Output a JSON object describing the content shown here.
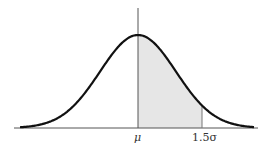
{
  "chart_data": {
    "type": "area",
    "title": "",
    "x_ticks": [
      "μ",
      "1.5σ"
    ],
    "shaded_region": {
      "from": "μ",
      "to": "1.5σ"
    },
    "xlabel": "",
    "ylabel": "",
    "grid": false
  },
  "labels": {
    "mu": "μ",
    "sigma_mark": "1.5σ"
  },
  "colors": {
    "curve": "#111111",
    "shade": "#e6e6e6",
    "axis": "#555555"
  }
}
